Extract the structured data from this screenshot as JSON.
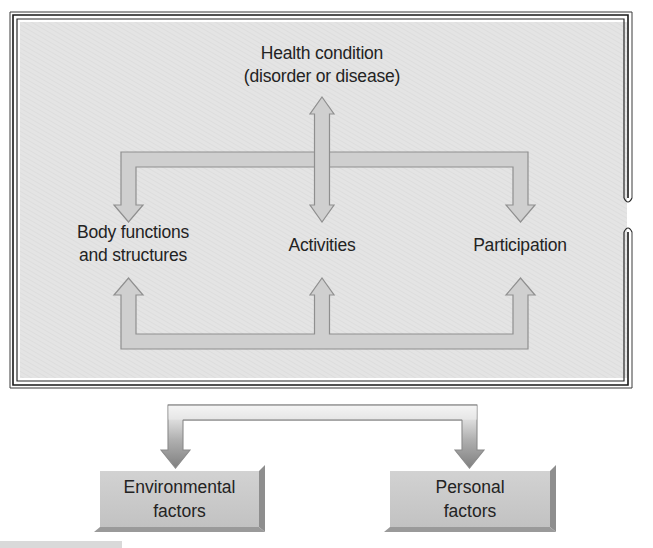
{
  "figure": {
    "nodes": {
      "health_condition": {
        "line1": "Health condition",
        "line2": "(disorder or disease)"
      },
      "body_functions": {
        "line1": "Body functions",
        "line2": "and structures"
      },
      "activities": {
        "label": "Activities"
      },
      "participation": {
        "label": "Participation"
      },
      "environmental_factors": {
        "line1": "Environmental",
        "line2": "factors"
      },
      "personal_factors": {
        "line1": "Personal",
        "line2": "factors"
      }
    },
    "colors": {
      "panel_fill": "#e3e3e3",
      "arrow_fill": "#cfcfcf",
      "arrow_stroke": "#8f8f8f",
      "frame_line": "#1a1a1a",
      "box_fill": "#c8c8c8"
    }
  }
}
